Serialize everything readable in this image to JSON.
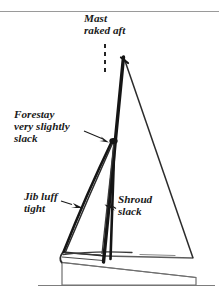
{
  "figure": {
    "background_color": "#ffffff",
    "ink_color": "#1a1a1a",
    "rule_color": "#8c8c8c",
    "top_rule": {
      "present": true,
      "y": 11
    }
  },
  "labels": {
    "mast": {
      "name": "mast-raked-aft",
      "lines": [
        "Mast",
        "raked aft"
      ],
      "line1": "Mast",
      "line2": "raked aft",
      "x": 84,
      "y": 22
    },
    "forestay": {
      "name": "forestay-very-slightly-slack",
      "lines": [
        "Forestay",
        "very slightly",
        "slack"
      ],
      "line1": "Forestay",
      "line2": "very slightly",
      "line3": "slack",
      "x": 14,
      "y": 118
    },
    "jib": {
      "name": "jib-luff-tight",
      "lines": [
        "Jib luff",
        "tight"
      ],
      "line1": "Jib luff",
      "line2": "tight",
      "x": 24,
      "y": 200
    },
    "shroud": {
      "name": "shroud-slack",
      "lines": [
        "Shroud",
        "slack"
      ],
      "line1": "Shroud",
      "line2": "slack",
      "x": 118,
      "y": 203
    }
  },
  "parts": {
    "mast": {
      "label": "mast",
      "head_x": 123,
      "head_y": 57,
      "foot_x": 103,
      "foot_y": 262
    },
    "mainsail": {
      "label": "mainsail",
      "head": [
        124,
        58
      ],
      "clew": [
        193,
        258
      ],
      "tack": [
        104,
        260
      ]
    },
    "jib": {
      "label": "jib",
      "head": [
        113,
        140
      ],
      "tack": [
        63,
        252
      ],
      "clew": [
        100,
        255
      ]
    },
    "forestay": {
      "label": "forestay",
      "top": [
        113,
        140
      ],
      "bottom": [
        64,
        252
      ],
      "state": "very slightly slack"
    },
    "shroud": {
      "label": "shroud",
      "top": [
        114,
        141
      ],
      "bottom": [
        110,
        258
      ],
      "state": "slack"
    },
    "hull": {
      "label": "hull",
      "bow_x": 62,
      "stern_x": 196,
      "deck_y": 263,
      "waterline_y": 285
    },
    "waterline": {
      "label": "waterline",
      "x1": 38,
      "x2": 215,
      "y": 285
    },
    "rake_reference": {
      "label": "vertical-dashed-reference",
      "x": 105,
      "y1": 44,
      "y2": 73,
      "style": "dashed"
    }
  },
  "leaders": {
    "forestay_arrow": {
      "name": "forestay-leader-arrow",
      "from": [
        86,
        132
      ],
      "to": [
        110,
        143
      ]
    },
    "jib_arrow": {
      "name": "jib-leader-arrow",
      "from": [
        60,
        203
      ],
      "to": [
        84,
        208
      ]
    },
    "shroud_arrow": {
      "name": "shroud-leader-arrow",
      "from": [
        116,
        208
      ],
      "to": [
        105,
        205
      ]
    }
  }
}
